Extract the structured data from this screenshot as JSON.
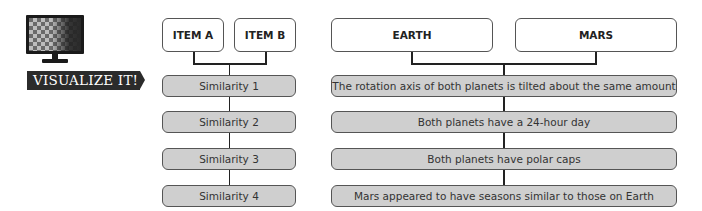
{
  "badge": {
    "label": "VISUALIZE IT!",
    "icon": "monitor-icon"
  },
  "left_diagram": {
    "items": [
      "ITEM A",
      "ITEM B"
    ],
    "similarities": [
      "Similarity 1",
      "Similarity 2",
      "Similarity 3",
      "Similarity 4"
    ]
  },
  "right_diagram": {
    "items": [
      "EARTH",
      "MARS"
    ],
    "similarities": [
      "The rotation axis of both planets is tilted about the same amount",
      "Both planets have a 24-hour day",
      "Both planets have polar caps",
      "Mars appeared to have seasons similar to those on Earth"
    ]
  },
  "colors": {
    "box_fill": "#cfcfcf",
    "border": "#555555",
    "banner": "#2b2b2b"
  }
}
